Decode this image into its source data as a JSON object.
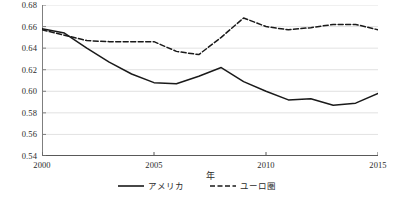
{
  "chart_data": {
    "type": "line",
    "title": "",
    "xlabel": "年",
    "ylabel": "",
    "xlim": [
      2000,
      2015
    ],
    "ylim": [
      0.54,
      0.68
    ],
    "grid": true,
    "legend_position": "bottom",
    "x": [
      2000,
      2001,
      2002,
      2003,
      2004,
      2005,
      2006,
      2007,
      2008,
      2009,
      2010,
      2011,
      2012,
      2013,
      2014,
      2015
    ],
    "yticks": [
      0.54,
      0.56,
      0.58,
      0.6,
      0.62,
      0.64,
      0.66,
      0.68
    ],
    "ytick_labels": [
      "0.54",
      "0.56",
      "0.58",
      "0.60",
      "0.62",
      "0.64",
      "0.66",
      "0.68"
    ],
    "xticks": [
      2000,
      2005,
      2010,
      2015
    ],
    "xtick_labels": [
      "2000",
      "2005",
      "2010",
      "2015"
    ],
    "series": [
      {
        "name": "アメリカ",
        "style": "solid",
        "color": "#1a1a1a",
        "values": [
          0.658,
          0.654,
          0.64,
          0.627,
          0.616,
          0.608,
          0.607,
          0.614,
          0.622,
          0.609,
          0.6,
          0.592,
          0.593,
          0.587,
          0.589,
          0.598
        ]
      },
      {
        "name": "ユーロ圏",
        "style": "dashed",
        "color": "#1a1a1a",
        "values": [
          0.657,
          0.652,
          0.647,
          0.646,
          0.646,
          0.646,
          0.637,
          0.634,
          0.65,
          0.668,
          0.66,
          0.657,
          0.659,
          0.662,
          0.662,
          0.657
        ]
      }
    ]
  },
  "legend": {
    "items": [
      {
        "label": "アメリカ",
        "style": "solid"
      },
      {
        "label": "ユーロ圏",
        "style": "dashed"
      }
    ]
  }
}
